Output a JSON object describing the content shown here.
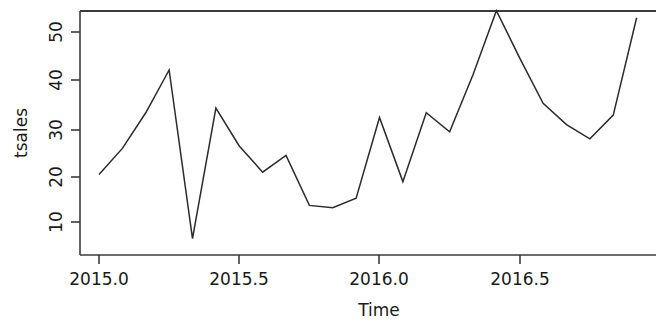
{
  "chart_data": {
    "type": "line",
    "title": "",
    "xlabel": "Time",
    "ylabel": "tsales",
    "xlim": [
      2014.96,
      2017.0
    ],
    "ylim": [
      6.5,
      56.0
    ],
    "grid": false,
    "legend": null,
    "x_tick_labels": [
      "2015.0",
      "2015.5",
      "2016.0",
      "2016.5"
    ],
    "x_tick_values": [
      2015.0,
      2015.5,
      2016.0,
      2016.5
    ],
    "y_tick_labels": [
      "10",
      "20",
      "30",
      "40",
      "50"
    ],
    "y_tick_values": [
      10,
      20,
      30,
      40,
      50
    ],
    "line_color": "#2b2b2b",
    "series": [
      {
        "name": "tsales",
        "x": [
          2015.0,
          2015.0833,
          2015.1667,
          2015.25,
          2015.3333,
          2015.4167,
          2015.5,
          2015.5833,
          2015.6667,
          2015.75,
          2015.8333,
          2015.9167,
          2016.0,
          2016.0833,
          2016.1667,
          2016.25,
          2016.3333,
          2016.4167,
          2016.5,
          2016.5833,
          2016.6667,
          2016.75,
          2016.8333,
          2016.9167
        ],
        "values": [
          20.0,
          25.5,
          33.0,
          42.0,
          6.5,
          34.0,
          26.0,
          20.5,
          24.0,
          13.5,
          13.0,
          15.0,
          32.0,
          18.5,
          33.0,
          29.0,
          41.0,
          54.5,
          44.5,
          35.0,
          30.5,
          27.5,
          32.5,
          53.0
        ]
      }
    ]
  },
  "axes": {
    "y_axis_name": "y-axis",
    "x_axis_name": "x-axis"
  }
}
